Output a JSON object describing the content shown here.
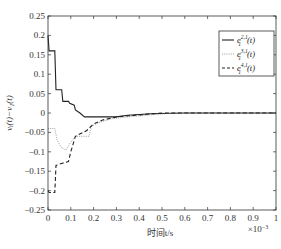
{
  "chart_data": {
    "type": "line",
    "title": "",
    "xlabel": "时间t/s",
    "x_multiplier": "×10⁻³",
    "ylabel": "vᵢ(t)−v₁(t)",
    "xlim": [
      0,
      1
    ],
    "ylim": [
      -0.25,
      0.25
    ],
    "grid": false,
    "legend_position": "upper right",
    "x_ticks": [
      "0",
      "0.1",
      "0.2",
      "0.3",
      "0.4",
      "0.5",
      "0.6",
      "0.7",
      "0.8",
      "0.9",
      "1"
    ],
    "y_ticks": [
      "0.25",
      "0.2",
      "0.15",
      "0.1",
      "0.05",
      "0",
      "−0.05",
      "−0.1",
      "−0.15",
      "−0.2",
      "−0.25"
    ],
    "series": [
      {
        "name": "e₁^{2,1}(t)",
        "style": "solid",
        "color": "#222222",
        "x": [
          0,
          0.005,
          0.03,
          0.035,
          0.06,
          0.065,
          0.09,
          0.095,
          0.115,
          0.12,
          0.14,
          0.16,
          0.3,
          0.35,
          0.45,
          0.6,
          1.0
        ],
        "y": [
          0.2,
          0.16,
          0.16,
          0.06,
          0.06,
          0.03,
          0.03,
          0.025,
          0.02,
          0.008,
          0.0,
          -0.01,
          -0.01,
          -0.006,
          -0.002,
          0.0,
          0.0
        ]
      },
      {
        "name": "e₁^{3,1}(t)",
        "style": "dotted",
        "color": "#888888",
        "x": [
          0,
          0.03,
          0.04,
          0.06,
          0.08,
          0.1,
          0.12,
          0.18,
          0.19,
          0.22,
          0.28,
          0.35,
          0.45,
          0.55,
          1.0
        ],
        "y": [
          -0.04,
          -0.04,
          -0.07,
          -0.09,
          -0.095,
          -0.075,
          -0.06,
          -0.06,
          -0.035,
          -0.025,
          -0.015,
          -0.01,
          -0.005,
          0.0,
          0.0
        ]
      },
      {
        "name": "e₁^{4,1}(t)",
        "style": "dashed",
        "color": "#222222",
        "x": [
          0,
          0.005,
          0.03,
          0.035,
          0.06,
          0.09,
          0.1,
          0.12,
          0.17,
          0.2,
          0.24,
          0.3,
          0.4,
          0.5,
          1.0
        ],
        "y": [
          -0.2,
          -0.205,
          -0.205,
          -0.135,
          -0.13,
          -0.125,
          -0.1,
          -0.06,
          -0.045,
          -0.028,
          -0.018,
          -0.01,
          -0.005,
          0.0,
          0.0
        ]
      }
    ]
  },
  "legend": {
    "items": [
      {
        "base": "e",
        "sub": "1",
        "sup": "2,1",
        "arg": "(t)"
      },
      {
        "base": "e",
        "sub": "1",
        "sup": "3,1",
        "arg": "(t)"
      },
      {
        "base": "e",
        "sub": "1",
        "sup": "4,1",
        "arg": "(t)"
      }
    ]
  },
  "axes": {
    "xlabel": "时间t/s",
    "x_multiplier": "×10",
    "x_multiplier_exp": "−3",
    "ylabel": "vᵢ(t)−v₁(t)"
  },
  "caption_fragment": "(d)"
}
